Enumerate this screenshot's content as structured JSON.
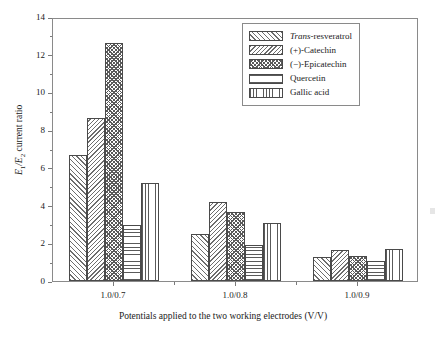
{
  "chart_data": {
    "type": "bar",
    "title": "",
    "xlabel": "Potentials applied to the two working electrodes (V/V)",
    "ylabel": "E1/E2 current ratio",
    "categories": [
      "1.0/0.7",
      "1.0/0.8",
      "1.0/0.9"
    ],
    "ylim": [
      0,
      14
    ],
    "ytick_values": [
      0,
      2,
      4,
      6,
      8,
      10,
      12,
      14
    ],
    "ytick_labels": [
      "0",
      "2",
      "4",
      "6",
      "8",
      "10",
      "12",
      "14"
    ],
    "y_minor_ticks": [
      1,
      3,
      5,
      7,
      9,
      11,
      13
    ],
    "grid": false,
    "legend_position": "top-right",
    "series": [
      {
        "name": "Trans-resveratrol",
        "pattern": "diagonal-forward-hatch",
        "values": [
          6.7,
          2.5,
          1.25
        ]
      },
      {
        "name": "(+)-Catechin",
        "pattern": "diagonal-backward-hatch",
        "values": [
          8.65,
          4.2,
          1.65
        ]
      },
      {
        "name": "(−)-Epicatechin",
        "pattern": "crosshatch",
        "values": [
          12.6,
          3.65,
          1.35
        ]
      },
      {
        "name": "Quercetin",
        "pattern": "horizontal-lines",
        "values": [
          2.95,
          1.9,
          1.05
        ]
      },
      {
        "name": "Gallic acid",
        "pattern": "vertical-lines",
        "values": [
          5.2,
          3.1,
          1.7
        ]
      }
    ]
  },
  "legend": {
    "entries": [
      {
        "label_italic": "Trans",
        "label_rest": "-resveratrol"
      },
      {
        "label_italic": "",
        "label_rest": "(+)-Catechin"
      },
      {
        "label_italic": "",
        "label_rest": "(−)-Epicatechin"
      },
      {
        "label_italic": "",
        "label_rest": "Quercetin"
      },
      {
        "label_italic": "",
        "label_rest": "Gallic acid"
      }
    ]
  },
  "axes": {
    "y_title_prefix": "E",
    "y_title_sub1": "1",
    "y_title_mid": "/E",
    "y_title_sub2": "2",
    "y_title_suffix": " current ratio",
    "x_title": "Potentials applied to the two working electrodes (V/V)"
  },
  "style": {
    "frame_color": "#8a8a8a",
    "bar_edge_color": "#4a4a4a",
    "hatch_color": "#5a5a5a",
    "text_color": "#1a1a1a",
    "background": "#ffffff"
  }
}
